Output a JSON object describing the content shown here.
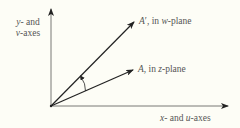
{
  "diagram": {
    "colors": {
      "background": "#fdfdf6",
      "ink": "#222222",
      "label": "#555555"
    },
    "axes": {
      "vertical_label_line1": "y- and",
      "vertical_label_line2": "v-axes",
      "horizontal_label": "x- and u-axes"
    },
    "vectors": [
      {
        "id": "A_prime",
        "label": "A′, in w-plane"
      },
      {
        "id": "A",
        "label": "A, in z-plane"
      }
    ],
    "annotations": {
      "rotation_arc": "curved arrow indicating rotation from A to A′"
    }
  }
}
